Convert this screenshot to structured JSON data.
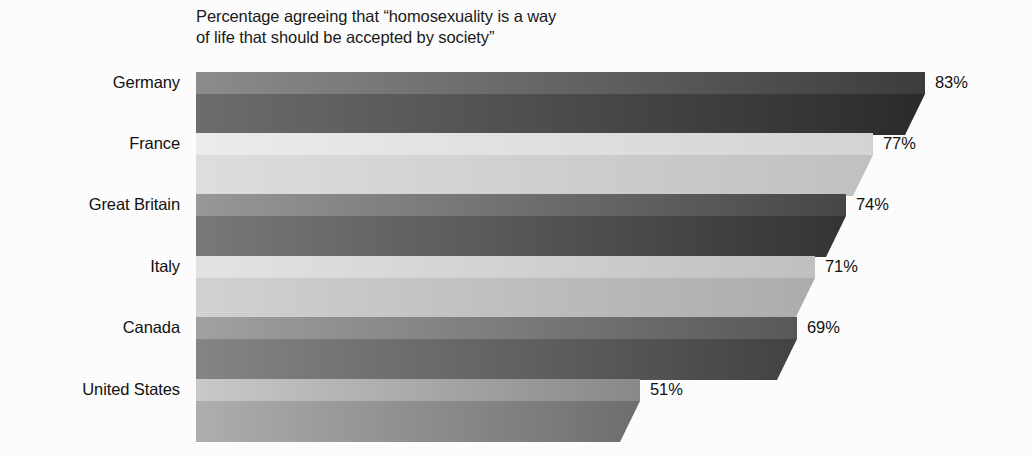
{
  "chart_data": {
    "type": "bar",
    "orientation": "horizontal",
    "title": "Percentage agreeing that “homosexuality is a way\nof life that should be accepted by society”",
    "xlabel": "",
    "ylabel": "",
    "xlim": [
      0,
      100
    ],
    "grid": false,
    "legend": null,
    "value_suffix": "%",
    "categories": [
      "Germany",
      "France",
      "Great Britain",
      "Italy",
      "Canada",
      "United States"
    ],
    "values": [
      83,
      77,
      74,
      71,
      69,
      51
    ],
    "value_labels": [
      "83%",
      "77%",
      "74%",
      "71%",
      "69%",
      "51%"
    ],
    "series": [
      {
        "name": "Percentage agreeing",
        "values": [
          83,
          77,
          74,
          71,
          69,
          51
        ]
      }
    ],
    "bars": [
      {
        "category": "Germany",
        "value": 83,
        "value_label": "83%",
        "top_face_light": "#8d8d8d",
        "top_face_dark": "#3d3d3d",
        "front_face_light": "#6e6e6e",
        "front_face_dark": "#2b2b2b",
        "side_face": "#232323"
      },
      {
        "category": "France",
        "value": 77,
        "value_label": "77%",
        "top_face_light": "#efefef",
        "top_face_dark": "#d6d6d6",
        "front_face_light": "#e0e0e0",
        "front_face_dark": "#c3c3c3",
        "side_face": "#bdbdbd"
      },
      {
        "category": "Great Britain",
        "value": 74,
        "value_label": "74%",
        "top_face_light": "#9a9a9a",
        "top_face_dark": "#474747",
        "front_face_light": "#7a7a7a",
        "front_face_dark": "#343434",
        "side_face": "#2c2c2c"
      },
      {
        "category": "Italy",
        "value": 71,
        "value_label": "71%",
        "top_face_light": "#e6e6e6",
        "top_face_dark": "#c2c2c2",
        "front_face_light": "#d4d4d4",
        "front_face_dark": "#aeaeae",
        "side_face": "#a8a8a8"
      },
      {
        "category": "Canada",
        "value": 69,
        "value_label": "69%",
        "top_face_light": "#a3a3a3",
        "top_face_dark": "#595959",
        "front_face_light": "#868686",
        "front_face_dark": "#434343",
        "side_face": "#3c3c3c"
      },
      {
        "category": "United States",
        "value": 51,
        "value_label": "51%",
        "top_face_light": "#cccccc",
        "top_face_dark": "#8a8a8a",
        "front_face_light": "#b0b0b0",
        "front_face_dark": "#6f6f6f",
        "side_face": "#686868"
      }
    ]
  },
  "layout": {
    "plot_left_px": 196,
    "row_top_px": [
      72,
      133,
      194,
      256,
      317,
      379
    ],
    "bar_end_px": [
      925,
      873,
      846,
      815,
      797,
      640
    ],
    "bar_top_face_h": 22,
    "bar_front_face_h": 21,
    "bevel_px": 20,
    "label_gap_px": 10
  }
}
